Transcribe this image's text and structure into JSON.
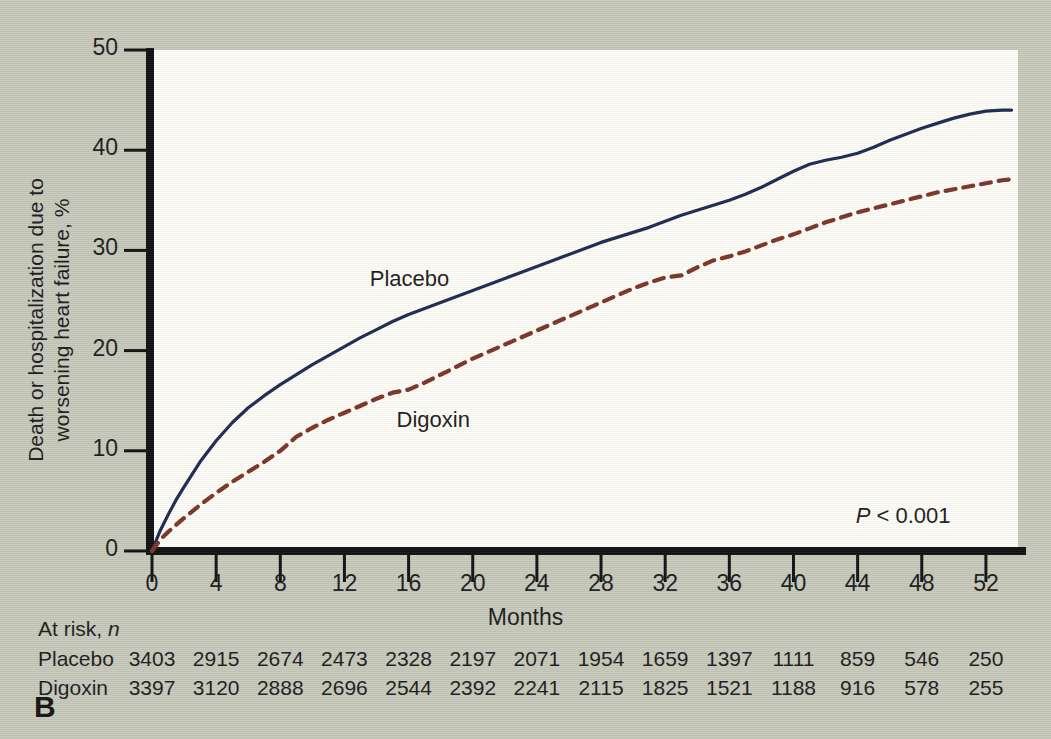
{
  "panel": {
    "label": "B"
  },
  "chart_data": {
    "type": "line",
    "title": "",
    "xlabel": "Months",
    "ylabel_line1": "Death or hospitalization due to",
    "ylabel_line2": "worsening heart failure, %",
    "xlim": [
      0,
      54
    ],
    "ylim": [
      0,
      50
    ],
    "grid": false,
    "legend_position": "inline-annotation",
    "xticks": [
      0,
      4,
      8,
      12,
      16,
      20,
      24,
      28,
      32,
      36,
      40,
      44,
      48,
      52
    ],
    "xticklabels": [
      "0",
      "4",
      "8",
      "12",
      "16",
      "20",
      "24",
      "28",
      "32",
      "36",
      "40",
      "44",
      "48",
      "52"
    ],
    "yticks": [
      0,
      10,
      20,
      30,
      40,
      50
    ],
    "yticklabels": [
      "0",
      "10",
      "20",
      "30",
      "40",
      "50"
    ],
    "annotations": [
      {
        "name": "p-value",
        "text_prefix": "P",
        "text_rest": " < 0.001",
        "x": 46,
        "y": 3.2
      }
    ],
    "series": [
      {
        "name": "Placebo",
        "label": "Placebo",
        "color": "#1b2a52",
        "style": "solid",
        "width": 3.2,
        "label_x": 14.2,
        "label_y": 27.0,
        "x": [
          0,
          0.5,
          1,
          1.5,
          2,
          3,
          4,
          5,
          6,
          7,
          8,
          9,
          10,
          11,
          12,
          13,
          14,
          15,
          16,
          17,
          18,
          19,
          20,
          21,
          22,
          23,
          24,
          25,
          26,
          27,
          28,
          29,
          30,
          31,
          32,
          33,
          34,
          35,
          36,
          37,
          38,
          39,
          40,
          41,
          42,
          43,
          44,
          45,
          46,
          47,
          48,
          49,
          50,
          51,
          52,
          53,
          53.6
        ],
        "y": [
          0,
          2.0,
          3.6,
          5.1,
          6.4,
          8.9,
          11.0,
          12.8,
          14.3,
          15.5,
          16.6,
          17.6,
          18.6,
          19.5,
          20.4,
          21.3,
          22.1,
          22.9,
          23.6,
          24.2,
          24.8,
          25.4,
          26.0,
          26.6,
          27.2,
          27.8,
          28.4,
          29.0,
          29.6,
          30.2,
          30.8,
          31.3,
          31.8,
          32.3,
          32.9,
          33.5,
          34.0,
          34.5,
          35.0,
          35.6,
          36.3,
          37.1,
          37.9,
          38.6,
          39.0,
          39.3,
          39.7,
          40.3,
          41.0,
          41.6,
          42.2,
          42.7,
          43.2,
          43.6,
          43.9,
          44.0,
          44.0
        ]
      },
      {
        "name": "Digoxin",
        "label": "Digoxin",
        "color": "#7b3526",
        "style": "dashed",
        "width": 4.2,
        "label_x": 15.0,
        "label_y": 13.0,
        "x": [
          0,
          0.5,
          1,
          2,
          3,
          4,
          5,
          6,
          7,
          8,
          9,
          10,
          11,
          12,
          13,
          14,
          15,
          16,
          17,
          18,
          19,
          20,
          21,
          22,
          23,
          24,
          25,
          26,
          27,
          28,
          29,
          30,
          31,
          32,
          33,
          34,
          35,
          36,
          37,
          38,
          39,
          40,
          41,
          42,
          43,
          44,
          45,
          46,
          47,
          48,
          49,
          50,
          51,
          52,
          53,
          53.6
        ],
        "y": [
          0,
          1.1,
          1.9,
          3.3,
          4.6,
          5.8,
          6.9,
          7.9,
          8.9,
          10.0,
          11.4,
          12.3,
          13.1,
          13.8,
          14.5,
          15.2,
          15.8,
          16.1,
          16.8,
          17.6,
          18.4,
          19.2,
          19.9,
          20.6,
          21.3,
          22.0,
          22.7,
          23.4,
          24.1,
          24.8,
          25.5,
          26.2,
          26.8,
          27.3,
          27.5,
          28.3,
          29.0,
          29.4,
          29.9,
          30.5,
          31.1,
          31.6,
          32.2,
          32.8,
          33.3,
          33.8,
          34.2,
          34.6,
          35.0,
          35.4,
          35.8,
          36.1,
          36.4,
          36.7,
          37.0,
          37.1
        ]
      }
    ]
  },
  "at_risk": {
    "title_text": "At risk, ",
    "title_italic": "n",
    "rows": [
      {
        "name": "Placebo",
        "values": [
          "3403",
          "2915",
          "2674",
          "2473",
          "2328",
          "2197",
          "2071",
          "1954",
          "1659",
          "1397",
          "1111",
          "859",
          "546",
          "250"
        ]
      },
      {
        "name": "Digoxin",
        "values": [
          "3397",
          "3120",
          "2888",
          "2696",
          "2544",
          "2392",
          "2241",
          "2115",
          "1825",
          "1521",
          "1188",
          "916",
          "578",
          "255"
        ]
      }
    ]
  },
  "colors": {
    "background": "#c6c8ba",
    "plot_area": "#fdfcf7",
    "axis": "#111111",
    "placebo": "#1b2a52",
    "digoxin": "#7b3526",
    "text": "#1c1c1c"
  }
}
